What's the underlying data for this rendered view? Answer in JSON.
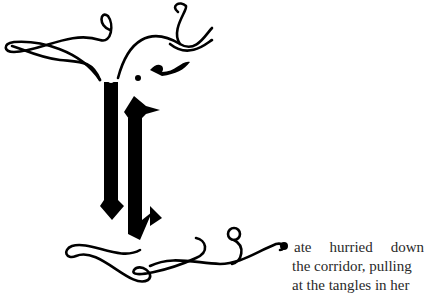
{
  "dropcap": {
    "letter": "K",
    "style": "ornamental-blackletter",
    "color": "#000000"
  },
  "body_text": {
    "lines": [
      [
        "ate",
        "hurried",
        "down"
      ],
      [
        "the corridor, pulling"
      ],
      [
        "at the tangles in her"
      ]
    ]
  }
}
